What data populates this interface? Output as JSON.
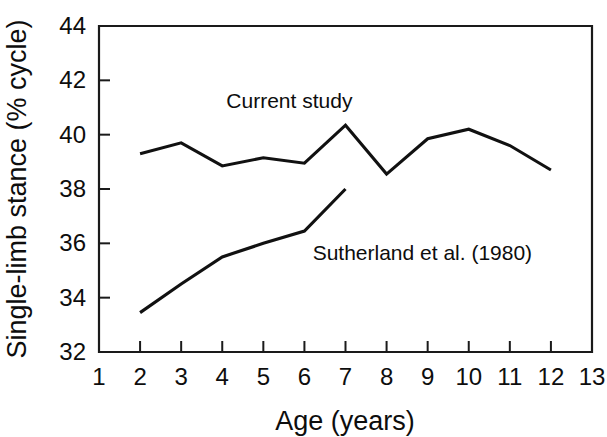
{
  "chart_data": {
    "type": "line",
    "title": "",
    "xlabel": "Age (years)",
    "ylabel": "Single-limb stance (% cycle)",
    "xlim": [
      1,
      13
    ],
    "ylim": [
      32,
      44
    ],
    "xticks": [
      1,
      2,
      3,
      4,
      5,
      6,
      7,
      8,
      9,
      10,
      11,
      12,
      13
    ],
    "yticks": [
      32,
      34,
      36,
      38,
      40,
      42,
      44
    ],
    "xtick_labels": [
      "1",
      "2",
      "3",
      "4",
      "5",
      "6",
      "7",
      "8",
      "9",
      "10",
      "11",
      "12",
      "13"
    ],
    "ytick_labels": [
      "32",
      "34",
      "36",
      "38",
      "40",
      "42",
      "44"
    ],
    "grid": false,
    "legend_position": "inline-annotation",
    "series": [
      {
        "name": "Current study",
        "label_x": 4.1,
        "label_y": 41.0,
        "color": "#111111",
        "x": [
          2,
          3,
          4,
          5,
          6,
          7,
          8,
          9,
          10,
          11,
          12
        ],
        "values": [
          39.3,
          39.7,
          38.85,
          39.15,
          38.95,
          40.35,
          38.55,
          39.85,
          40.2,
          39.6,
          38.7
        ]
      },
      {
        "name": "Sutherland et al. (1980)",
        "label_x": 6.2,
        "label_y": 35.4,
        "color": "#111111",
        "x": [
          2,
          3,
          4,
          5,
          6,
          7
        ],
        "values": [
          33.45,
          34.5,
          35.5,
          36.0,
          36.45,
          38.0
        ]
      }
    ]
  },
  "labels": {
    "series_1": "Current study",
    "series_2": "Sutherland et al. (1980)",
    "x_axis_title": "Age (years)",
    "y_axis_title": "Single-limb stance (% cycle)"
  }
}
